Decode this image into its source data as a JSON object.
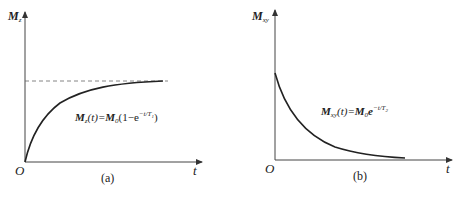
{
  "panels": [
    {
      "id": "a",
      "y_axis_label": {
        "main": "M",
        "sub": "z"
      },
      "x_axis_label": "t",
      "origin_label": "O",
      "caption": "(a)",
      "formula": {
        "lhs_main": "M",
        "lhs_sub": "z",
        "lhs_arg": "(t)=",
        "rhs_main": "M",
        "rhs_sub": "0",
        "rhs_open": "(1−e",
        "rhs_exp": "−t/T",
        "rhs_exp_sub": "1",
        "rhs_close": ")"
      },
      "curve": "exponential recovery approaching dashed asymptote M0"
    },
    {
      "id": "b",
      "y_axis_label": {
        "main": "M",
        "sub": "xy"
      },
      "x_axis_label": "t",
      "origin_label": "O",
      "caption": "(b)",
      "formula": {
        "lhs_main": "M",
        "lhs_sub": "xy",
        "lhs_arg": "(t)=",
        "rhs_main": "M",
        "rhs_sub": "0",
        "rhs_e": "e",
        "rhs_exp": "−t/T",
        "rhs_exp_sub": "2"
      },
      "curve": "exponential decay toward zero"
    }
  ],
  "colors": {
    "ink": "#222222",
    "axis": "#444444",
    "dashed": "#666666",
    "background": "#ffffff"
  }
}
